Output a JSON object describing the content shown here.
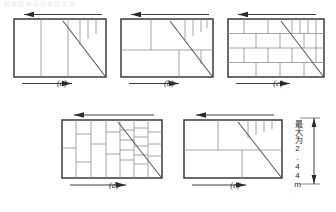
{
  "figure": {
    "top_cut_text": "砌体结构设计规范应用",
    "panels": [
      {
        "id": "a",
        "caption": "(a)",
        "top_arrow_direction": "left",
        "bottom_arrow_direction": "right",
        "pattern_name": "few-vertical-joints",
        "width_m": 2.44
      },
      {
        "id": "b",
        "caption": "(b)",
        "top_arrow_direction": "left",
        "bottom_arrow_direction": "right",
        "pattern_name": "two-course-blockwork",
        "width_m": 2.44
      },
      {
        "id": "c",
        "caption": "(c)",
        "top_arrow_direction": "left",
        "bottom_arrow_direction": "right",
        "pattern_name": "four-course-stretcher-bond",
        "width_m": 2.44
      },
      {
        "id": "d",
        "caption": "(d)",
        "top_arrow_direction": "left",
        "bottom_arrow_direction": "right",
        "pattern_name": "vertical-stack-bond",
        "width_m": 2.44
      },
      {
        "id": "e",
        "caption": "(e)",
        "top_arrow_direction": "left",
        "bottom_arrow_direction": "right",
        "pattern_name": "two-course-coarse-bond",
        "width_m": 2.44
      }
    ],
    "dimension": {
      "label": "最大为2.44m",
      "value": "2.44",
      "unit": "m",
      "orientation": "vertical",
      "arrow_style": "double-headed"
    },
    "colors": {
      "frame": "#3b3b3b",
      "inner_line": "#8a8a8a",
      "diagonal": "#5a5a5a",
      "arrow": "#2a2a2a",
      "text": "#1d1d1d"
    }
  }
}
